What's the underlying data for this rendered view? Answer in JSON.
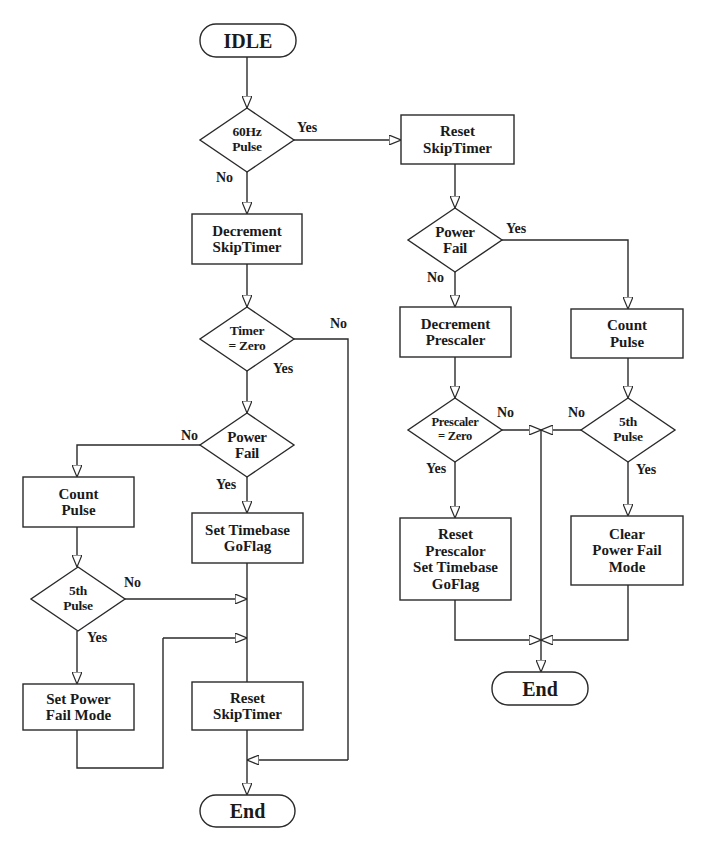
{
  "diagram": {
    "type": "flowchart",
    "stroke_color": "#2a2a2a",
    "background": "#ffffff",
    "nodes": {
      "idle": {
        "text": "IDLE",
        "shape": "terminal"
      },
      "pulse60": {
        "text": "60Hz\nPulse",
        "shape": "decision"
      },
      "dec_skip": {
        "text": "Decrement\nSkipTimer",
        "shape": "process"
      },
      "timer_zero": {
        "text": "Timer\n= Zero",
        "shape": "decision"
      },
      "pf_left": {
        "text": "Power\nFail",
        "shape": "decision"
      },
      "count_left": {
        "text": "Count\nPulse",
        "shape": "process"
      },
      "fifth_left": {
        "text": "5th\nPulse",
        "shape": "decision"
      },
      "set_pfm": {
        "text": "Set Power\nFail Mode",
        "shape": "process"
      },
      "set_tb": {
        "text": "Set Timebase\nGoFlag",
        "shape": "process"
      },
      "reset_skip_left": {
        "text": "Reset\nSkipTimer",
        "shape": "process"
      },
      "end_left": {
        "text": "End",
        "shape": "terminal"
      },
      "reset_skip_right": {
        "text": "Reset\nSkipTimer",
        "shape": "process"
      },
      "pf_right": {
        "text": "Power\nFail",
        "shape": "decision"
      },
      "dec_pre": {
        "text": "Decrement\nPrescaler",
        "shape": "process"
      },
      "count_right": {
        "text": "Count\nPulse",
        "shape": "process"
      },
      "pre_zero": {
        "text": "Prescaler\n= Zero",
        "shape": "decision"
      },
      "fifth_right": {
        "text": "5th\nPulse",
        "shape": "decision"
      },
      "reset_pre": {
        "text": "Reset\nPrescalor\nSet Timebase\nGoFlag",
        "shape": "process"
      },
      "clear_pfm": {
        "text": "Clear\nPower Fail\nMode",
        "shape": "process"
      },
      "end_right": {
        "text": "End",
        "shape": "terminal"
      }
    },
    "edge_labels": {
      "pulse60_yes": "Yes",
      "pulse60_no": "No",
      "timer_zero_no": "No",
      "timer_zero_yes": "Yes",
      "pf_left_no": "No",
      "pf_left_yes": "Yes",
      "fifth_left_no": "No",
      "fifth_left_yes": "Yes",
      "pf_right_yes": "Yes",
      "pf_right_no": "No",
      "pre_zero_no": "No",
      "pre_zero_yes": "Yes",
      "fifth_right_no": "No",
      "fifth_right_yes": "Yes"
    }
  }
}
